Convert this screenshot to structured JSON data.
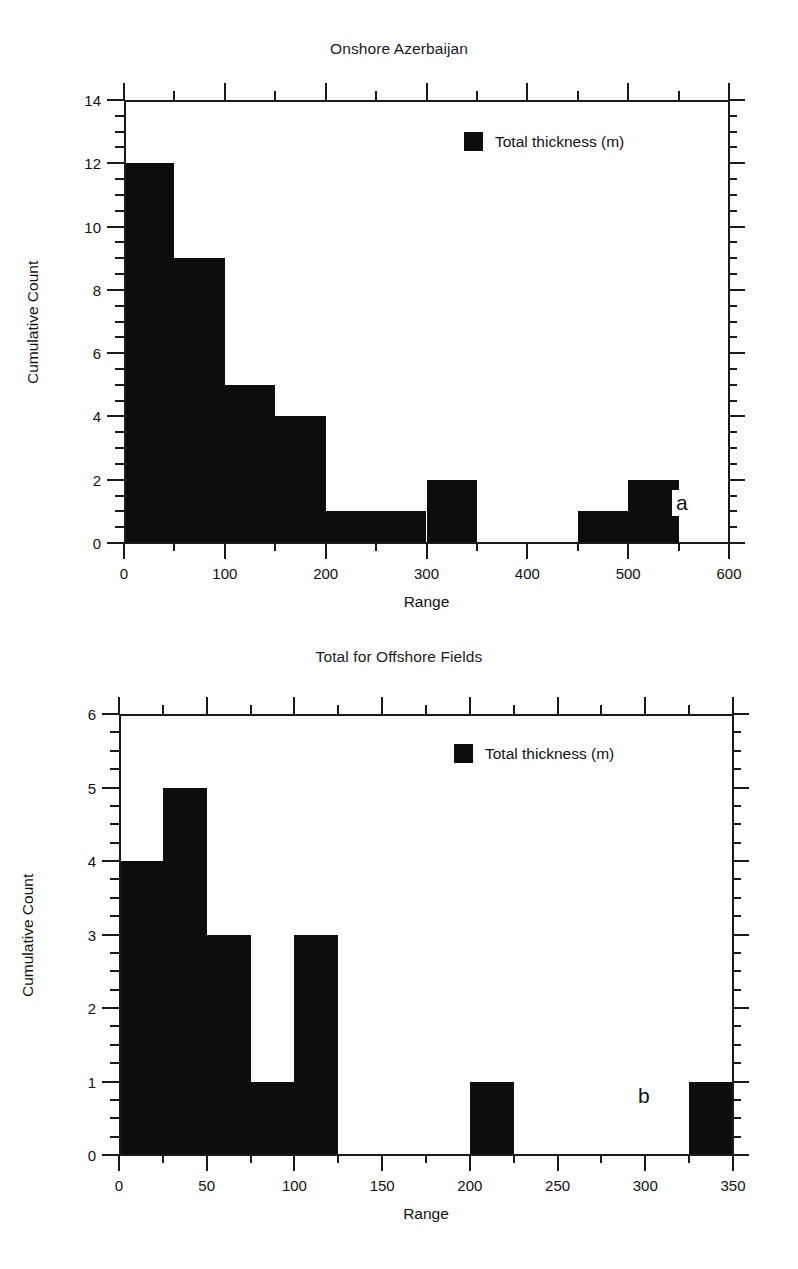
{
  "figure": {
    "background": "#ffffff",
    "ink_color": "#0d0d0d"
  },
  "panels": [
    {
      "tag": "a",
      "title": "Onshore Azerbaijan",
      "xlabel": "Range",
      "ylabel": "Cumulative Count",
      "legend_label": "Total thickness (m)"
    },
    {
      "tag": "b",
      "title": "Total for Offshore Fields",
      "xlabel": "Range",
      "ylabel": "Cumulative Count",
      "legend_label": "Total thickness (m)"
    }
  ],
  "chart_data": [
    {
      "type": "bar",
      "title": "Onshore Azerbaijan",
      "xlabel": "Range",
      "ylabel": "Cumulative Count",
      "panel_tag": "a",
      "legend": [
        "Total thickness (m)"
      ],
      "legend_position": "top-right inside",
      "grid": false,
      "xlim": [
        0,
        600
      ],
      "ylim": [
        0,
        14
      ],
      "xticks": [
        0,
        100,
        200,
        300,
        400,
        500,
        600
      ],
      "xticklabels": [
        "0",
        "100",
        "200",
        "300",
        "400",
        "500",
        "600"
      ],
      "xminor_step": 50,
      "yticks": [
        0,
        2,
        4,
        6,
        8,
        10,
        12,
        14
      ],
      "yticklabels": [
        "0",
        "2",
        "4",
        "6",
        "8",
        "10",
        "12",
        "14"
      ],
      "yminor_step": 0.5,
      "bin_width": 50,
      "bins": [
        {
          "x0": 0,
          "x1": 50,
          "value": 12
        },
        {
          "x0": 50,
          "x1": 100,
          "value": 9
        },
        {
          "x0": 100,
          "x1": 150,
          "value": 5
        },
        {
          "x0": 150,
          "x1": 200,
          "value": 4
        },
        {
          "x0": 200,
          "x1": 250,
          "value": 1
        },
        {
          "x0": 250,
          "x1": 300,
          "value": 1
        },
        {
          "x0": 300,
          "x1": 350,
          "value": 2
        },
        {
          "x0": 350,
          "x1": 400,
          "value": 0
        },
        {
          "x0": 400,
          "x1": 450,
          "value": 0
        },
        {
          "x0": 450,
          "x1": 500,
          "value": 1
        },
        {
          "x0": 500,
          "x1": 550,
          "value": 2
        },
        {
          "x0": 550,
          "x1": 600,
          "value": 0
        }
      ],
      "categories": [
        "0-50",
        "50-100",
        "100-150",
        "150-200",
        "200-250",
        "250-300",
        "300-350",
        "350-400",
        "400-450",
        "450-500",
        "500-550",
        "550-600"
      ],
      "values": [
        12,
        9,
        5,
        4,
        1,
        1,
        2,
        0,
        0,
        1,
        2,
        0
      ]
    },
    {
      "type": "bar",
      "title": "Total for Offshore Fields",
      "xlabel": "Range",
      "ylabel": "Cumulative Count",
      "panel_tag": "b",
      "legend": [
        "Total thickness (m)"
      ],
      "legend_position": "top-right inside",
      "grid": false,
      "xlim": [
        0,
        350
      ],
      "ylim": [
        0,
        6
      ],
      "xticks": [
        0,
        50,
        100,
        150,
        200,
        250,
        300,
        350
      ],
      "xticklabels": [
        "0",
        "50",
        "100",
        "150",
        "200",
        "250",
        "300",
        "350"
      ],
      "xminor_step": 25,
      "yticks": [
        0,
        1,
        2,
        3,
        4,
        5,
        6
      ],
      "yticklabels": [
        "0",
        "1",
        "2",
        "3",
        "4",
        "5",
        "6"
      ],
      "yminor_step": 0.25,
      "bin_width": 25,
      "bins": [
        {
          "x0": 0,
          "x1": 25,
          "value": 4
        },
        {
          "x0": 25,
          "x1": 50,
          "value": 5
        },
        {
          "x0": 50,
          "x1": 75,
          "value": 3
        },
        {
          "x0": 75,
          "x1": 100,
          "value": 1
        },
        {
          "x0": 100,
          "x1": 125,
          "value": 3
        },
        {
          "x0": 125,
          "x1": 150,
          "value": 0
        },
        {
          "x0": 150,
          "x1": 175,
          "value": 0
        },
        {
          "x0": 175,
          "x1": 200,
          "value": 0
        },
        {
          "x0": 200,
          "x1": 225,
          "value": 1
        },
        {
          "x0": 225,
          "x1": 250,
          "value": 0
        },
        {
          "x0": 250,
          "x1": 275,
          "value": 0
        },
        {
          "x0": 275,
          "x1": 300,
          "value": 0
        },
        {
          "x0": 300,
          "x1": 325,
          "value": 0
        },
        {
          "x0": 325,
          "x1": 350,
          "value": 1
        }
      ],
      "categories": [
        "0-25",
        "25-50",
        "50-75",
        "75-100",
        "100-125",
        "125-150",
        "150-175",
        "175-200",
        "200-225",
        "225-250",
        "250-275",
        "275-300",
        "300-325",
        "325-350"
      ],
      "values": [
        4,
        5,
        3,
        1,
        3,
        0,
        0,
        0,
        1,
        0,
        0,
        0,
        0,
        1
      ]
    }
  ]
}
